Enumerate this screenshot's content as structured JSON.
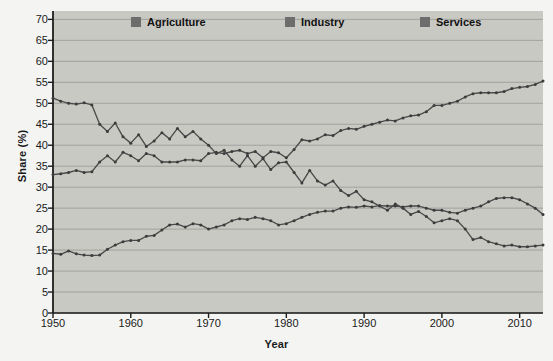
{
  "chart_data": {
    "type": "line",
    "title": "",
    "xlabel": "Year",
    "ylabel": "Share (%)",
    "xlim": [
      1950,
      2013
    ],
    "ylim": [
      0,
      72
    ],
    "yticks": [
      0,
      5,
      10,
      15,
      20,
      25,
      30,
      35,
      40,
      45,
      50,
      55,
      60,
      65,
      70
    ],
    "xticks": [
      1950,
      1960,
      1970,
      1980,
      1990,
      2000,
      2010
    ],
    "grid": "horizontal",
    "legend_position": "top-inside",
    "plot_background": "#c9c9c4",
    "figure_background": "#f4f4f2",
    "line_color": "#4a4a4a",
    "marker_color": "#3c3c3c",
    "x": [
      1950,
      1951,
      1952,
      1953,
      1954,
      1955,
      1956,
      1957,
      1958,
      1959,
      1960,
      1961,
      1962,
      1963,
      1964,
      1965,
      1966,
      1967,
      1968,
      1969,
      1970,
      1971,
      1972,
      1973,
      1974,
      1975,
      1976,
      1977,
      1978,
      1979,
      1980,
      1981,
      1982,
      1983,
      1984,
      1985,
      1986,
      1987,
      1988,
      1989,
      1990,
      1991,
      1992,
      1993,
      1994,
      1995,
      1996,
      1997,
      1998,
      1999,
      2000,
      2001,
      2002,
      2003,
      2004,
      2005,
      2006,
      2007,
      2008,
      2009,
      2010,
      2011,
      2012,
      2013
    ],
    "series": [
      {
        "name": "Agriculture",
        "color": "#4a4a4a",
        "values": [
          51.2,
          50.5,
          50.0,
          49.8,
          50.1,
          49.6,
          45.0,
          43.3,
          45.3,
          42.0,
          40.5,
          42.5,
          39.7,
          41.0,
          43.0,
          41.5,
          44.0,
          42.0,
          43.3,
          41.5,
          40.0,
          38.0,
          38.8,
          36.5,
          35.0,
          37.5,
          35.0,
          36.8,
          34.2,
          35.8,
          36.0,
          33.5,
          31.0,
          34.0,
          31.5,
          30.5,
          31.5,
          29.2,
          28.0,
          29.0,
          27.0,
          26.5,
          25.5,
          24.5,
          26.0,
          25.0,
          23.5,
          24.2,
          23.0,
          21.5,
          22.0,
          22.5,
          22.0,
          20.0,
          17.5,
          18.0,
          17.0,
          16.5,
          16.0,
          16.2,
          15.8,
          15.8,
          16.0,
          16.2
        ]
      },
      {
        "name": "Industry",
        "color": "#4a4a4a",
        "values": [
          14.2,
          14.0,
          14.8,
          14.1,
          13.8,
          13.7,
          13.8,
          15.2,
          16.2,
          17.0,
          17.3,
          17.3,
          18.3,
          18.5,
          19.8,
          21.0,
          21.2,
          20.5,
          21.3,
          21.0,
          20.0,
          20.5,
          21.0,
          22.0,
          22.5,
          22.3,
          22.8,
          22.5,
          22.0,
          21.0,
          21.3,
          22.0,
          22.8,
          23.5,
          24.0,
          24.3,
          24.3,
          25.0,
          25.3,
          25.2,
          25.5,
          25.3,
          25.6,
          25.5,
          25.5,
          25.3,
          25.5,
          25.5,
          25.0,
          24.5,
          24.5,
          24.0,
          23.8,
          24.5,
          25.0,
          25.5,
          26.5,
          27.3,
          27.5,
          27.5,
          27.0,
          26.0,
          25.0,
          23.5
        ]
      },
      {
        "name": "Services",
        "color": "#4a4a4a",
        "values": [
          33.0,
          33.2,
          33.5,
          34.0,
          33.5,
          33.7,
          36.0,
          37.5,
          36.0,
          38.3,
          37.5,
          36.3,
          38.0,
          37.5,
          36.0,
          36.0,
          36.0,
          36.5,
          36.5,
          36.3,
          38.0,
          38.3,
          38.0,
          38.5,
          38.8,
          38.0,
          38.5,
          37.0,
          38.5,
          38.2,
          37.0,
          39.0,
          41.3,
          41.0,
          41.5,
          42.5,
          42.3,
          43.5,
          44.0,
          43.8,
          44.5,
          45.0,
          45.5,
          46.0,
          45.8,
          46.5,
          47.0,
          47.2,
          48.0,
          49.5,
          49.5,
          50.0,
          50.5,
          51.5,
          52.3,
          52.5,
          52.5,
          52.5,
          52.8,
          53.5,
          53.8,
          54.0,
          54.5,
          55.3
        ]
      }
    ]
  },
  "legend": {
    "items": [
      {
        "label": "Agriculture",
        "swatch_color": "#6d6d6d"
      },
      {
        "label": "Industry",
        "swatch_color": "#6d6d6d"
      },
      {
        "label": "Services",
        "swatch_color": "#6d6d6d"
      }
    ]
  }
}
